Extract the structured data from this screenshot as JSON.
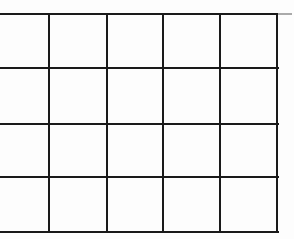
{
  "grid": {
    "columns": 5,
    "rows": 4,
    "line_color": "#1a1a1a",
    "background": "#ffffff",
    "extension_color": "#aaaaaa",
    "cells": [
      [
        "",
        "",
        "",
        "",
        ""
      ],
      [
        "",
        "",
        "",
        "",
        ""
      ],
      [
        "",
        "",
        "",
        "",
        ""
      ],
      [
        "",
        "",
        "",
        "",
        ""
      ]
    ]
  }
}
